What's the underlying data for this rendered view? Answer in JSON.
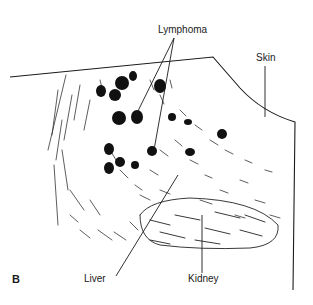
{
  "figure": {
    "panel_label": "B",
    "labels": {
      "lymphoma": "Lymphoma",
      "skin": "Skin",
      "liver": "Liver",
      "kidney": "Kidney"
    },
    "ink_color": "#1a1a1a",
    "background": "#ffffff"
  }
}
